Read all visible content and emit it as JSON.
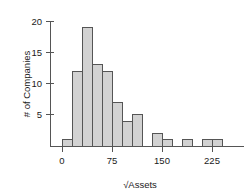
{
  "chart_data": {
    "type": "bar",
    "title": "",
    "subtitle": "",
    "xlabel": "√Assets",
    "ylabel": "# of Companies",
    "xlim": [
      -8,
      248
    ],
    "ylim": [
      0,
      21
    ],
    "grid": false,
    "legend": null,
    "bin_width": 15,
    "bin_starts": [
      0,
      15,
      30,
      45,
      60,
      75,
      90,
      105,
      120,
      135,
      150,
      165,
      180,
      195,
      210,
      225,
      240
    ],
    "categories": [
      "0-15",
      "15-30",
      "30-45",
      "45-60",
      "60-75",
      "75-90",
      "90-105",
      "105-120",
      "120-135",
      "135-150",
      "150-165",
      "165-180",
      "180-195",
      "195-210",
      "210-225",
      "225-240",
      "240-255"
    ],
    "values": [
      1,
      12,
      19,
      13,
      12,
      7,
      4,
      5,
      0,
      2,
      1,
      0,
      1,
      0,
      1,
      1,
      0
    ],
    "x_ticks": [
      {
        "value": 0,
        "label": "0"
      },
      {
        "value": 75,
        "label": "75"
      },
      {
        "value": 150,
        "label": "150"
      },
      {
        "value": 225,
        "label": "225"
      }
    ],
    "y_ticks": [
      {
        "value": 5,
        "label": "5"
      },
      {
        "value": 10,
        "label": "10"
      },
      {
        "value": 15,
        "label": "15"
      },
      {
        "value": 20,
        "label": "20"
      }
    ],
    "colors": {
      "bar_fill": "#d2d2d2",
      "bar_stroke": "#555555",
      "axis": "#555555",
      "text": "#1a1a1a",
      "background": "#ffffff"
    }
  }
}
